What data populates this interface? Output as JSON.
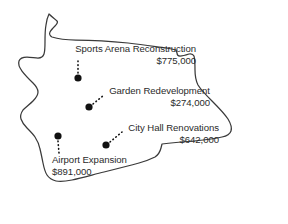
{
  "map": {
    "title": "city-boundary-outline",
    "outline_color": "#3a3a3a",
    "fill_color": "#ffffff",
    "marker_color": "#111111",
    "leader_line_style": "dotted"
  },
  "projects": [
    {
      "id": "sports-arena",
      "name": "Sports Arena Reconstruction",
      "amount": "$775,000",
      "marker": {
        "x": 78,
        "y": 78
      },
      "leader": {
        "x1": 78,
        "y1": 73,
        "x2": 78,
        "y2": 59
      },
      "align": "right"
    },
    {
      "id": "garden-redevelopment",
      "name": "Garden Redevelopment",
      "amount": "$274,000",
      "marker": {
        "x": 89,
        "y": 107
      },
      "leader": {
        "x1": 93,
        "y1": 104,
        "x2": 104,
        "y2": 95
      },
      "align": "right"
    },
    {
      "id": "city-hall",
      "name": "City Hall Renovations",
      "amount": "$642,000",
      "marker": {
        "x": 106,
        "y": 145
      },
      "leader": {
        "x1": 110,
        "y1": 142,
        "x2": 122,
        "y2": 132
      },
      "align": "right"
    },
    {
      "id": "airport-expansion",
      "name": "Airport Expansion",
      "amount": "$891,000",
      "marker": {
        "x": 58,
        "y": 136
      },
      "leader": {
        "x1": 58,
        "y1": 141,
        "x2": 59,
        "y2": 153
      },
      "align": "left"
    }
  ]
}
